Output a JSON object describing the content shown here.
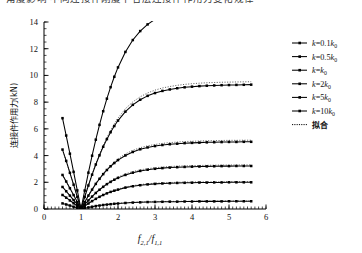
{
  "page": {
    "clipped_caption_above": "角度影响 不同连接件刚度下各层连接件作用力变化规律"
  },
  "chart_data": {
    "type": "line",
    "title": "",
    "xlabel": "f2,1/f1,1",
    "xlabel_parts": {
      "num_base": "f",
      "num_sub": "2,1",
      "den_base": "f",
      "den_sub": "1,1",
      "slash": "/"
    },
    "ylabel": "连接件作用力(kN)",
    "xlim": [
      0,
      6
    ],
    "ylim": [
      0,
      14
    ],
    "xticks": [
      0,
      1,
      2,
      3,
      4,
      5,
      6
    ],
    "yticks": [
      0,
      2,
      4,
      6,
      8,
      10,
      12,
      14
    ],
    "xtick_labels": [
      "0",
      "1",
      "2",
      "3",
      "4",
      "5",
      "6"
    ],
    "ytick_labels": [
      "0",
      "2",
      "4",
      "6",
      "8",
      "10",
      "12",
      "14"
    ],
    "minor_xticks_step": 0.1,
    "minor_yticks_step": 0.5,
    "grid": false,
    "legend_position": "right-outside-top",
    "marker": "square",
    "converge_point": [
      1.0,
      0.0
    ],
    "x": [
      0.5,
      0.6,
      0.7,
      0.8,
      0.9,
      1.0,
      1.1,
      1.2,
      1.3,
      1.4,
      1.5,
      1.6,
      1.7,
      1.8,
      1.9,
      2.0,
      2.2,
      2.4,
      2.6,
      2.8,
      3.0,
      3.2,
      3.4,
      3.6,
      3.8,
      4.0,
      4.2,
      4.4,
      4.6,
      4.8,
      5.0,
      5.2,
      5.4,
      5.6
    ],
    "series": [
      {
        "name": "k=0.1k0",
        "label_parts": {
          "base": "k",
          "eq": "=",
          "coef": "0.1",
          "k": "k",
          "sub": "0"
        },
        "style": "solid-marker",
        "values": [
          0.42,
          0.34,
          0.26,
          0.17,
          0.09,
          0.0,
          0.06,
          0.12,
          0.17,
          0.22,
          0.26,
          0.3,
          0.33,
          0.36,
          0.39,
          0.41,
          0.45,
          0.48,
          0.5,
          0.52,
          0.53,
          0.54,
          0.55,
          0.55,
          0.56,
          0.56,
          0.57,
          0.57,
          0.57,
          0.57,
          0.58,
          0.58,
          0.58,
          0.58
        ]
      },
      {
        "name": "k=0.5k0",
        "label_parts": {
          "base": "k",
          "eq": "=",
          "coef": "0.5",
          "k": "k",
          "sub": "0"
        },
        "style": "solid-marker",
        "values": [
          1.05,
          0.85,
          0.64,
          0.43,
          0.22,
          0.0,
          0.21,
          0.41,
          0.59,
          0.76,
          0.91,
          1.05,
          1.17,
          1.28,
          1.37,
          1.45,
          1.6,
          1.7,
          1.78,
          1.84,
          1.88,
          1.91,
          1.93,
          1.95,
          1.96,
          1.97,
          1.98,
          1.98,
          1.99,
          1.99,
          2.0,
          2.0,
          2.0,
          2.0
        ]
      },
      {
        "name": "k=k0",
        "label_parts": {
          "base": "k",
          "eq": "=",
          "coef": "",
          "k": "k",
          "sub": "0"
        },
        "style": "solid-marker",
        "values": [
          1.65,
          1.33,
          1.0,
          0.67,
          0.34,
          0.0,
          0.33,
          0.64,
          0.93,
          1.2,
          1.44,
          1.66,
          1.86,
          2.03,
          2.19,
          2.33,
          2.55,
          2.72,
          2.85,
          2.94,
          3.01,
          3.06,
          3.1,
          3.13,
          3.15,
          3.17,
          3.18,
          3.19,
          3.2,
          3.21,
          3.21,
          3.22,
          3.22,
          3.22
        ]
      },
      {
        "name": "k=2k0",
        "label_parts": {
          "base": "k",
          "eq": "=",
          "coef": "2",
          "k": "k",
          "sub": "0"
        },
        "style": "solid-marker",
        "values": [
          2.55,
          2.06,
          1.55,
          1.04,
          0.52,
          0.0,
          0.51,
          1.0,
          1.45,
          1.88,
          2.26,
          2.61,
          2.92,
          3.2,
          3.44,
          3.66,
          4.01,
          4.27,
          4.47,
          4.61,
          4.71,
          4.79,
          4.85,
          4.89,
          4.93,
          4.95,
          4.97,
          4.99,
          5.0,
          5.01,
          5.02,
          5.02,
          5.03,
          5.03
        ]
      },
      {
        "name": "k=5k0",
        "label_parts": {
          "base": "k",
          "eq": "=",
          "coef": "5",
          "k": "k",
          "sub": "0"
        },
        "style": "solid-marker",
        "values": [
          4.45,
          3.6,
          2.71,
          1.82,
          0.91,
          0.0,
          0.9,
          1.76,
          2.57,
          3.33,
          4.02,
          4.66,
          5.23,
          5.75,
          6.21,
          6.62,
          7.29,
          7.8,
          8.18,
          8.47,
          8.68,
          8.84,
          8.95,
          9.04,
          9.11,
          9.16,
          9.2,
          9.23,
          9.25,
          9.27,
          9.28,
          9.29,
          9.3,
          9.31
        ]
      },
      {
        "name": "k=10k0",
        "label_parts": {
          "base": "k",
          "eq": "=",
          "coef": "10",
          "k": "k",
          "sub": "0"
        },
        "style": "solid-marker",
        "values": [
          6.8,
          5.5,
          4.14,
          2.78,
          1.39,
          0.0,
          1.38,
          2.72,
          3.99,
          5.19,
          6.3,
          7.32,
          8.26,
          9.12,
          9.9,
          10.6,
          11.76,
          12.65,
          13.32,
          13.82,
          14.2,
          14.48,
          14.69,
          14.85,
          14.97,
          15.06,
          15.13,
          15.18,
          15.22,
          15.25,
          15.28,
          15.3,
          15.31,
          15.32
        ]
      }
    ],
    "fit": {
      "name": "拟合",
      "label": "拟合",
      "style": "dotted",
      "description": "Fitted dotted curves overlaid on each stiffness series",
      "series_offsets": [
        0.02,
        0.05,
        0.08,
        0.12,
        0.22,
        0.0
      ]
    },
    "legend_entries": [
      "k=0.1k0",
      "k=0.5k0",
      "k=k0",
      "k=2k0",
      "k=5k0",
      "k=10k0",
      "拟合"
    ]
  }
}
